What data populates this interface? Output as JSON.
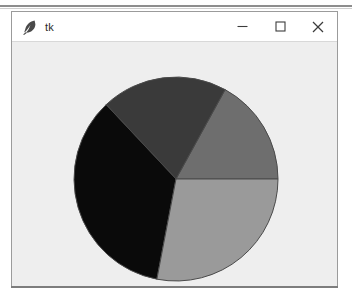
{
  "window": {
    "title": "tk",
    "icon": "feather-icon",
    "controls": {
      "minimize_label": "–",
      "maximize_label": "□",
      "close_label": "×"
    },
    "frame_color": "#9b9b9b",
    "titlebar_color": "#ffffff",
    "canvas_background": "#eeeeee"
  },
  "chart_data": {
    "type": "pie",
    "title": "",
    "xlabel": "",
    "ylabel": "",
    "legend": "none",
    "grid": false,
    "center": {
      "x": 164,
      "y": 137
    },
    "radius": 102,
    "start_angle": 0,
    "direction": "counterclockwise",
    "edge_color": "#4a4a4a",
    "labels": [
      "Slice 1",
      "Slice 2",
      "Slice 3",
      "Slice 4"
    ],
    "values": [
      17,
      20,
      35,
      28
    ],
    "percentages": [
      17,
      20,
      35,
      28
    ],
    "angles_deg": [
      61.2,
      72.0,
      126.0,
      100.8
    ],
    "boundaries_deg": [
      0,
      61.2,
      133.2,
      259.2,
      360
    ],
    "colors": [
      "#6e6e6e",
      "#3a3a3a",
      "#0a0a0a",
      "#9a9a9a"
    ],
    "slices": [
      {
        "label": "Slice 1",
        "value": 17,
        "percent": 17,
        "color": "#6e6e6e",
        "start_deg": 0,
        "end_deg": 61.2
      },
      {
        "label": "Slice 2",
        "value": 20,
        "percent": 20,
        "color": "#3a3a3a",
        "start_deg": 61.2,
        "end_deg": 133.2
      },
      {
        "label": "Slice 3",
        "value": 35,
        "percent": 35,
        "color": "#0a0a0a",
        "start_deg": 133.2,
        "end_deg": 259.2
      },
      {
        "label": "Slice 4",
        "value": 28,
        "percent": 28,
        "color": "#9a9a9a",
        "start_deg": 259.2,
        "end_deg": 360
      }
    ]
  }
}
